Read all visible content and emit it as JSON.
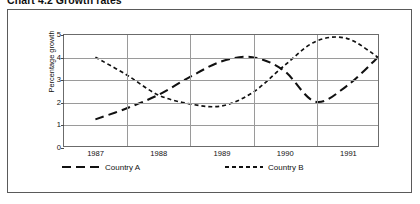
{
  "title": "Chart 4.2  Growth rates",
  "axes": {
    "y_label": "Percentage growth",
    "y_ticks": [
      "0",
      "1",
      "2",
      "3",
      "4",
      "5"
    ],
    "x_ticks": [
      "1987",
      "1988",
      "1989",
      "1990",
      "1991"
    ]
  },
  "legend": {
    "entries": [
      {
        "label": "Country A",
        "dash": "long-dash",
        "swatch_name": "legend-swatch-long-dash"
      },
      {
        "label": "Country B",
        "dash": "short-dash",
        "swatch_name": "legend-swatch-short-dash"
      }
    ]
  },
  "chart_data": {
    "type": "line",
    "title": "Chart 4.2  Growth rates",
    "xlabel": "",
    "ylabel": "Percentage growth",
    "ylim": [
      0,
      5
    ],
    "yticks": [
      0,
      1,
      2,
      3,
      4,
      5
    ],
    "grid": true,
    "legend_position": "bottom",
    "categories": [
      "1987",
      "1988",
      "1989",
      "1990",
      "1991"
    ],
    "x_band_centers": [
      1987,
      1988,
      1989,
      1990,
      1991
    ],
    "series": [
      {
        "name": "Country A",
        "dash": "long-dash",
        "x": [
          1987.0,
          1987.5,
          1988.0,
          1988.5,
          1989.0,
          1989.5,
          1990.0,
          1990.5,
          1991.0,
          1991.5
        ],
        "values": [
          1.2,
          1.7,
          2.3,
          3.1,
          3.8,
          4.0,
          3.4,
          2.0,
          2.7,
          4.0
        ]
      },
      {
        "name": "Country B",
        "dash": "short-dash",
        "x": [
          1987.0,
          1987.5,
          1988.0,
          1988.5,
          1989.0,
          1989.5,
          1990.0,
          1990.5,
          1991.0,
          1991.5
        ],
        "values": [
          4.0,
          3.2,
          2.3,
          1.9,
          1.8,
          2.4,
          3.6,
          4.7,
          4.85,
          4.0
        ]
      }
    ],
    "annotations": [
      {
        "text": "curves cross near 2.2 between 1987 and 1988"
      },
      {
        "text": "both series converge at 4.0 at right edge"
      }
    ]
  }
}
